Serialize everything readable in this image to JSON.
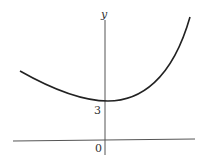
{
  "diagram": {
    "type": "function-graph",
    "axes": {
      "x_axis": {
        "label": ""
      },
      "y_axis": {
        "label": "y"
      },
      "origin_label": "0"
    },
    "annotations": {
      "y_intercept_label": "3"
    },
    "curve": {
      "description": "convex curve decreasing from left, minimum near y-intercept 3, rising steeply to the right",
      "y_intercept": 3
    },
    "colors": {
      "axis": "#555555",
      "curve": "#222222",
      "text": "#333333"
    }
  }
}
